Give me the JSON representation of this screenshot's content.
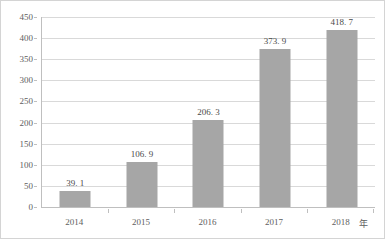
{
  "chart_data": {
    "type": "bar",
    "title": "",
    "xlabel": "年",
    "ylabel": "",
    "categories": [
      "2014",
      "2015",
      "2016",
      "2017",
      "2018"
    ],
    "values": [
      39.1,
      106.9,
      206.3,
      373.9,
      418.7
    ],
    "data_labels": [
      "39. 1",
      "106. 9",
      "206. 3",
      "373. 9",
      "418. 7"
    ],
    "ylim": [
      0,
      450
    ],
    "ytick_step": 50,
    "ytick_labels": [
      "0",
      "50",
      "100",
      "150",
      "200",
      "250",
      "300",
      "350",
      "400",
      "450"
    ],
    "grid": true,
    "legend": false,
    "series": [
      {
        "name": "",
        "values": [
          39.1,
          106.9,
          206.3,
          373.9,
          418.7
        ]
      }
    ],
    "colors": {
      "bar": "#a6a6a6",
      "gridline": "#d9d9d9",
      "axis": "#bfbfbf",
      "frame": "#d4d4d4",
      "label_text": "#4a4a4a",
      "tick_text": "#606060",
      "background": "#ffffff"
    }
  }
}
